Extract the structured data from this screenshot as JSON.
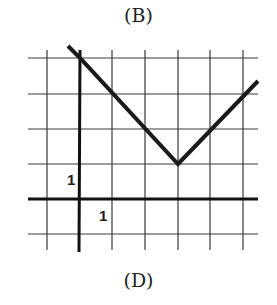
{
  "captions": {
    "top": "(B)",
    "bottom": "(D)"
  },
  "graph": {
    "type": "absolute-value-line",
    "axis_labels": {
      "x_unit": "1",
      "y_unit": "1"
    },
    "grid": {
      "x_min": -1,
      "x_max": 5.5,
      "y_min": -1,
      "y_max": 4.3
    },
    "vertex": [
      3,
      1
    ],
    "points": [
      [
        -0.35,
        4.3
      ],
      [
        0,
        4
      ],
      [
        3,
        1
      ],
      [
        5.5,
        3.4
      ]
    ],
    "colors": {
      "line": "#1a1a1a",
      "grid": "#3a3a3a",
      "background": "#ffffff"
    }
  }
}
